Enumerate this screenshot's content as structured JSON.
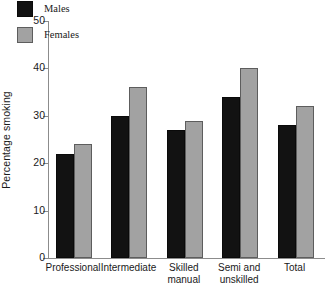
{
  "chart_data": {
    "type": "bar",
    "title": "",
    "subtitle": "",
    "xlabel": "",
    "ylabel": "Percentage smoking",
    "categories": [
      "Professional",
      "Intermediate",
      "Skilled\nmanual",
      "Semi and\nunskilled",
      "Total"
    ],
    "series": [
      {
        "name": "Males",
        "color": "#121212",
        "values": [
          22,
          30,
          27,
          34,
          28
        ]
      },
      {
        "name": "Females",
        "color": "#a2a2a2",
        "values": [
          24,
          36,
          29,
          40,
          32
        ]
      }
    ],
    "ylim": [
      0,
      50
    ],
    "yticks": [
      0,
      10,
      20,
      30,
      40,
      50
    ],
    "ytick_labels": [
      "0",
      "10",
      "20",
      "30",
      "40",
      "50"
    ],
    "grid": false,
    "legend": {
      "position": "top-left-inside",
      "entries": [
        {
          "label": "Males",
          "color": "#121212"
        },
        {
          "label": "Females",
          "color": "#a2a2a2"
        }
      ]
    },
    "axis_color": "#8c8c8c",
    "background": "#ffffff"
  }
}
